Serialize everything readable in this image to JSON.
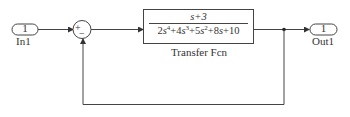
{
  "diagram": {
    "type": "simulink-block-diagram",
    "blocks": {
      "inport": {
        "number": "1",
        "label": "In1"
      },
      "sum": {
        "signs": [
          "+",
          "-"
        ],
        "plus_sign": "+",
        "minus_sign": "−"
      },
      "transfer_fcn": {
        "label": "Transfer Fcn",
        "numerator": "s+3",
        "denominator_terms": [
          {
            "coef": "2",
            "var": "s",
            "exp": "4",
            "op": "+"
          },
          {
            "coef": "4",
            "var": "s",
            "exp": "3",
            "op": "+"
          },
          {
            "coef": "5",
            "var": "s",
            "exp": "2",
            "op": "+"
          },
          {
            "coef": "8",
            "var": "s",
            "exp": "",
            "op": "+"
          },
          {
            "coef": "10",
            "var": "",
            "exp": "",
            "op": ""
          }
        ]
      },
      "outport": {
        "number": "1",
        "label": "Out1"
      }
    },
    "connections": [
      "In1 -> Sum(+)",
      "Sum -> Transfer Fcn",
      "Transfer Fcn -> Out1",
      "Transfer Fcn -> Sum(-) (feedback)"
    ],
    "colors": {
      "line": "#444444",
      "background": "#ffffff"
    }
  }
}
